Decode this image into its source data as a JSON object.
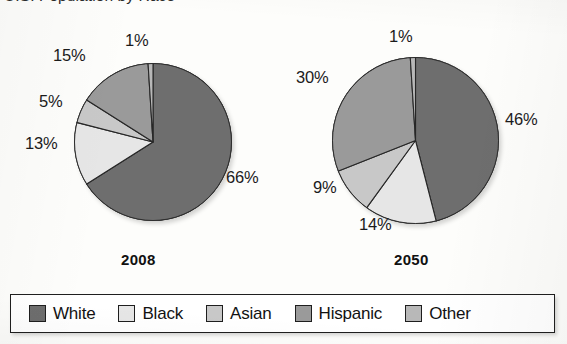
{
  "title": "U.S. Population by Race",
  "legend": {
    "items": [
      {
        "label": "White",
        "color": "#6e6e6e"
      },
      {
        "label": "Black",
        "color": "#e6e6e6"
      },
      {
        "label": "Asian",
        "color": "#c8c8c8"
      },
      {
        "label": "Hispanic",
        "color": "#9a9a9a"
      },
      {
        "label": "Other",
        "color": "#b8b8b8"
      }
    ]
  },
  "pies": [
    {
      "year": "2008",
      "labels": [
        "66%",
        "13%",
        "5%",
        "15%",
        "1%"
      ]
    },
    {
      "year": "2050",
      "labels": [
        "46%",
        "14%",
        "9%",
        "30%",
        "1%"
      ]
    }
  ],
  "chart_data": {
    "type": "pie",
    "title": "U.S. Population by Race",
    "xlabel": "",
    "ylabel": "",
    "legend_position": "bottom",
    "grid": false,
    "units": "percent",
    "categories": [
      "White",
      "Black",
      "Asian",
      "Hispanic",
      "Other"
    ],
    "colors": [
      "#6e6e6e",
      "#e6e6e6",
      "#c8c8c8",
      "#9a9a9a",
      "#b8b8b8"
    ],
    "start_angle_deg": 0,
    "direction": "clockwise",
    "series": [
      {
        "name": "2008",
        "values": [
          66,
          13,
          5,
          15,
          1
        ]
      },
      {
        "name": "2050",
        "values": [
          46,
          14,
          9,
          30,
          1
        ]
      }
    ],
    "charts": [
      {
        "title": "2008",
        "labels": [
          "White",
          "Black",
          "Asian",
          "Hispanic",
          "Other"
        ],
        "values": [
          66,
          13,
          5,
          15,
          1
        ],
        "data_labels": [
          "66%",
          "13%",
          "5%",
          "15%",
          "1%"
        ]
      },
      {
        "title": "2050",
        "labels": [
          "White",
          "Black",
          "Asian",
          "Hispanic",
          "Other"
        ],
        "values": [
          46,
          14,
          9,
          30,
          1
        ],
        "data_labels": [
          "46%",
          "14%",
          "9%",
          "30%",
          "1%"
        ]
      }
    ]
  }
}
